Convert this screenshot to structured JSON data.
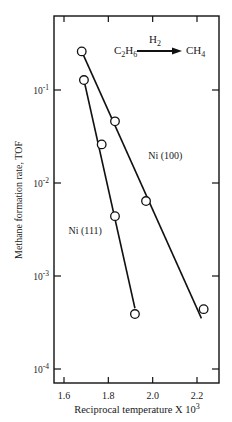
{
  "chart_data": {
    "type": "line",
    "title": "",
    "xlabel": "Reciprocal temperature X 10",
    "xlabel_superscript": "3",
    "ylabel": "Methane formation rate,  TOF",
    "x_scale": "linear",
    "y_scale": "log",
    "xlim": [
      1.55,
      2.3
    ],
    "ylim": [
      7e-05,
      0.5
    ],
    "x_ticks": [
      1.6,
      1.8,
      2.0,
      2.2
    ],
    "x_tick_labels": [
      "1.6",
      "1.8",
      "2.0",
      "2.2"
    ],
    "y_ticks": [
      0.1,
      0.01,
      0.001,
      0.0001
    ],
    "y_tick_labels": [
      {
        "base": "10",
        "exp": "-1"
      },
      {
        "base": "10",
        "exp": "-2"
      },
      {
        "base": "10",
        "exp": "-3"
      },
      {
        "base": "10",
        "exp": "-4"
      }
    ],
    "grid": false,
    "legend": "none (inline labels)",
    "annotation": {
      "reactant": "C2H6",
      "reagent": "H2",
      "product": "CH4"
    },
    "series": [
      {
        "name": "Ni (100)",
        "x": [
          1.68,
          1.83,
          1.97,
          2.23
        ],
        "y": [
          0.26,
          0.046,
          0.0064,
          0.00044
        ],
        "fit_line": {
          "x": [
            1.68,
            2.22
          ],
          "y": [
            0.26,
            0.00035
          ]
        },
        "label_pos": {
          "x": 1.98,
          "y": 0.018
        }
      },
      {
        "name": "Ni (111)",
        "x": [
          1.69,
          1.77,
          1.83,
          1.92
        ],
        "y": [
          0.128,
          0.026,
          0.0044,
          0.00039
        ],
        "fit_line": {
          "x": [
            1.69,
            1.92
          ],
          "y": [
            0.128,
            0.00045
          ]
        },
        "label_pos": {
          "x": 1.62,
          "y": 0.0028
        }
      }
    ]
  },
  "labels": {
    "reactant_main": "C",
    "reactant_sub1": "2",
    "reactant_mid": "H",
    "reactant_sub2": "6",
    "reagent_main": "H",
    "reagent_sub": "2",
    "product_main": "CH",
    "product_sub": "4"
  }
}
